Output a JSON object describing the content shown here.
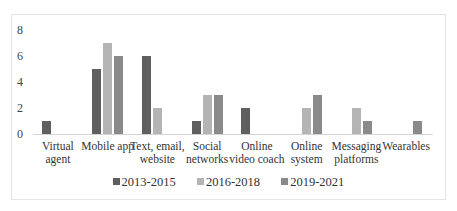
{
  "chart_data": {
    "type": "bar",
    "title": "",
    "xlabel": "",
    "ylabel": "",
    "ylim": [
      0,
      8
    ],
    "yticks": [
      0,
      2,
      4,
      6,
      8
    ],
    "grid": false,
    "legend_position": "bottom",
    "categories": [
      "Virtual agent",
      "Mobile app",
      "Text, email, website",
      "Social networks",
      "Online video coach",
      "Online system",
      "Messaging platforms",
      "Wearables"
    ],
    "category_lines": [
      [
        "Virtual",
        "agent"
      ],
      [
        "Mobile app",
        ""
      ],
      [
        "Text, email,",
        "website"
      ],
      [
        "Social",
        "networks"
      ],
      [
        "Online",
        "video coach"
      ],
      [
        "Online",
        "system"
      ],
      [
        "Messaging",
        "platforms"
      ],
      [
        "Wearables",
        ""
      ]
    ],
    "series": [
      {
        "name": "2013-2015",
        "color": "#5f5f5f",
        "values": [
          1,
          5,
          6,
          1,
          2,
          0,
          0,
          0
        ]
      },
      {
        "name": "2016-2018",
        "color": "#b4b4b4",
        "values": [
          0,
          7,
          2,
          3,
          0,
          2,
          2,
          0
        ]
      },
      {
        "name": "2019-2021",
        "color": "#8a8a8a",
        "values": [
          0,
          6,
          0,
          3,
          0,
          3,
          1,
          1
        ]
      }
    ]
  }
}
